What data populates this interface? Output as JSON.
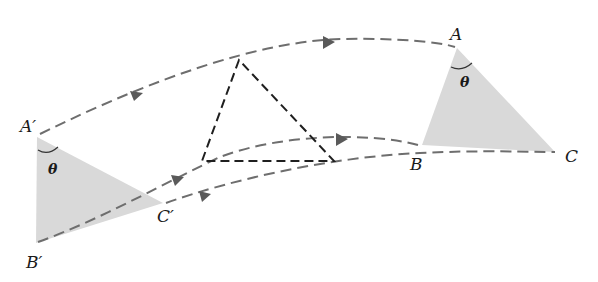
{
  "diagram": {
    "type": "rigid-body-displacement",
    "colors": {
      "triangle_fill": "#d9d9d9",
      "path_stroke": "#6e6e6e",
      "intermediate_stroke": "#1f1f1f",
      "arrow_fill": "#5a5a5a",
      "label": "#1a1a1a"
    },
    "initial_triangle": {
      "vertices": {
        "A": {
          "label": "A′",
          "x": 37,
          "y": 137
        },
        "B": {
          "label": "B′",
          "x": 36,
          "y": 243
        },
        "C": {
          "label": "C′",
          "x": 163,
          "y": 203
        }
      },
      "angle_label": "θ"
    },
    "final_triangle": {
      "vertices": {
        "A": {
          "label": "A",
          "x": 457,
          "y": 48
        },
        "B": {
          "label": "B",
          "x": 422,
          "y": 145
        },
        "C": {
          "label": "C",
          "x": 555,
          "y": 152
        }
      },
      "angle_label": "θ"
    },
    "intermediate_triangle": {
      "vertices": [
        {
          "x": 239,
          "y": 60
        },
        {
          "x": 202,
          "y": 161
        },
        {
          "x": 334,
          "y": 161
        }
      ]
    },
    "paths": [
      {
        "name": "path-A",
        "from": "A′",
        "to": "A"
      },
      {
        "name": "path-B",
        "from": "B′",
        "to": "B"
      },
      {
        "name": "path-C",
        "from": "C′",
        "to": "C"
      }
    ],
    "labels": {
      "A_prime": "A′",
      "B_prime": "B′",
      "C_prime": "C′",
      "A": "A",
      "B": "B",
      "C": "C",
      "theta_left": "θ",
      "theta_right": "θ"
    }
  }
}
